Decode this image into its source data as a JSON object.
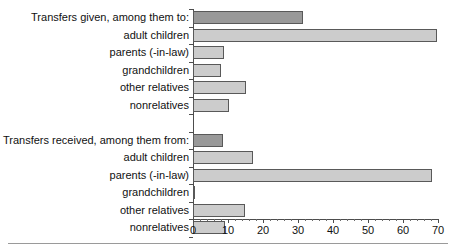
{
  "chart_data": {
    "type": "bar",
    "orientation": "horizontal",
    "title": "",
    "xlabel": "",
    "ylabel": "",
    "xlim": [
      0,
      70
    ],
    "xticks": [
      0,
      10,
      20,
      30,
      40,
      50,
      60,
      70
    ],
    "xtick_labels": [
      "0",
      "10",
      "20",
      "30",
      "40",
      "50",
      "60",
      "70"
    ],
    "minor_tick_step": 2,
    "grid": false,
    "legend": null,
    "groups": [
      {
        "name": "given",
        "header": {
          "label": "Transfers given, among them to:",
          "value": 31.5,
          "style": "dark"
        },
        "items": [
          {
            "label": "adult children",
            "value": 69.8,
            "style": "light"
          },
          {
            "label": "parents (-in-law)",
            "value": 8.9,
            "style": "light"
          },
          {
            "label": "grandchildren",
            "value": 8.0,
            "style": "light"
          },
          {
            "label": "other relatives",
            "value": 15.1,
            "style": "light"
          },
          {
            "label": "nonrelatives",
            "value": 10.3,
            "style": "light"
          }
        ]
      },
      {
        "name": "received",
        "header": {
          "label": "Transfers received, among them from:",
          "value": 8.7,
          "style": "dark"
        },
        "items": [
          {
            "label": "adult children",
            "value": 17.1,
            "style": "light"
          },
          {
            "label": "parents (-in-law)",
            "value": 68.3,
            "style": "light"
          },
          {
            "label": "grandchildren",
            "value": 0.5,
            "style": "light"
          },
          {
            "label": "other relatives",
            "value": 14.8,
            "style": "light"
          },
          {
            "label": "nonrelatives",
            "value": 9.1,
            "style": "light"
          }
        ]
      }
    ],
    "colors": {
      "bar_dark": "#999999",
      "bar_light": "#cccccc",
      "bar_border": "#595959",
      "axis": "#4d4d4d",
      "text": "#111111",
      "rule": "#9a9a9a"
    }
  }
}
